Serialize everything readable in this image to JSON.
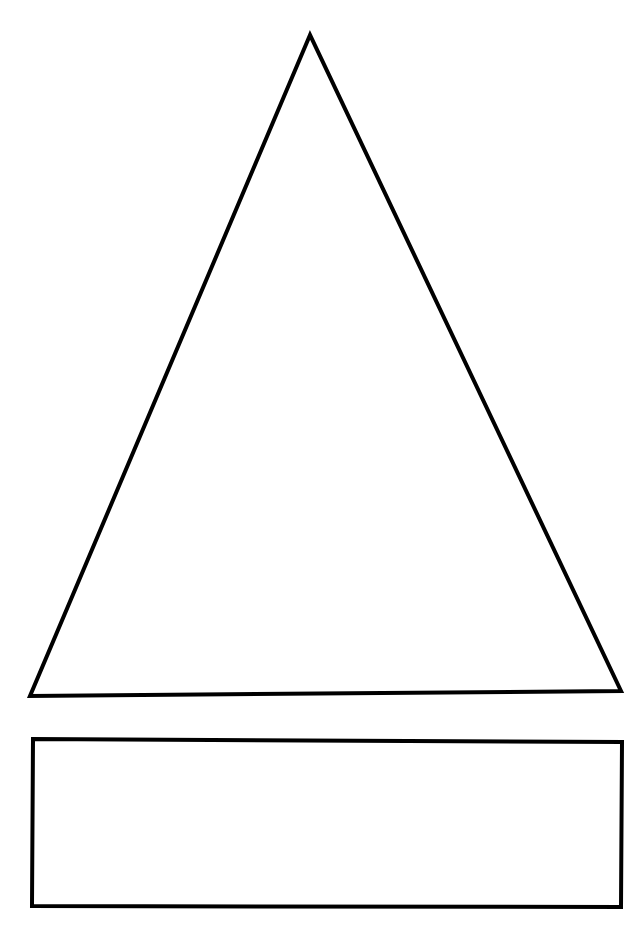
{
  "page": {
    "width": 642,
    "height": 925,
    "background": "#ffffff"
  },
  "diagram": {
    "stroke_color": "#000000",
    "stroke_width": 4,
    "fill": "none",
    "shapes": [
      {
        "id": "triangle",
        "type": "triangle",
        "points": [
          [
            310,
            35
          ],
          [
            30,
            696
          ],
          [
            621,
            691
          ]
        ]
      },
      {
        "id": "rectangle",
        "type": "rectangle",
        "points": [
          [
            33,
            739
          ],
          [
            622,
            742
          ],
          [
            621,
            907
          ],
          [
            32,
            906
          ]
        ]
      }
    ]
  }
}
